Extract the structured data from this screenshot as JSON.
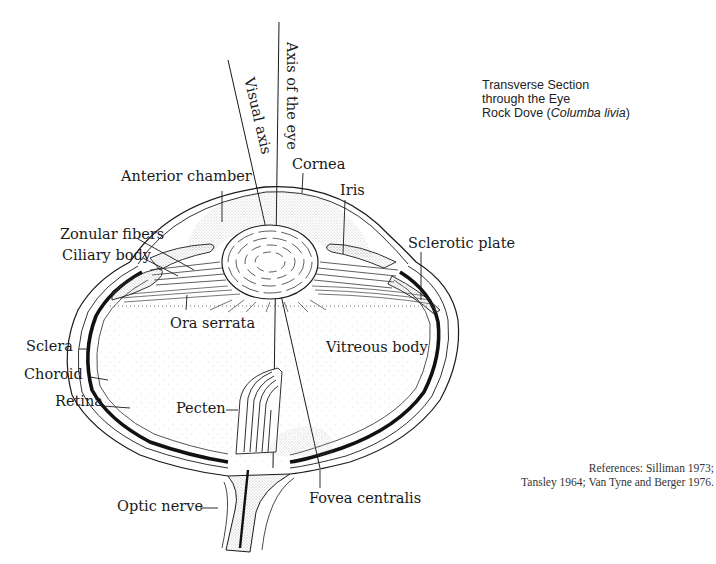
{
  "title": {
    "line1": "Transverse Section",
    "line2": "through the Eye",
    "line3_prefix": "Rock Dove (",
    "line3_species": "Columba livia",
    "line3_suffix": ")"
  },
  "references": {
    "line1": "References: Silliman 1973;",
    "line2": "Tansley 1964; Van Tyne and Berger 1976."
  },
  "axes": {
    "visual_axis": "Visual axis",
    "axis_of_eye": "Axis of the eye"
  },
  "labels": {
    "anterior_chamber": "Anterior chamber",
    "cornea": "Cornea",
    "iris": "Iris",
    "zonular_fibers": "Zonular fibers",
    "ciliary_body": "Ciliary body",
    "sclerotic_plate": "Sclerotic plate",
    "ora_serrata": "Ora serrata",
    "sclera": "Sclera",
    "vitreous_body": "Vitreous body",
    "choroid": "Choroid",
    "retina": "Retina",
    "pecten": "Pecten",
    "optic_nerve": "Optic nerve",
    "fovea_centralis": "Fovea centralis"
  },
  "colors": {
    "ink": "#1a1a1a",
    "stipple": "#9a9a9a",
    "background": "#ffffff"
  }
}
